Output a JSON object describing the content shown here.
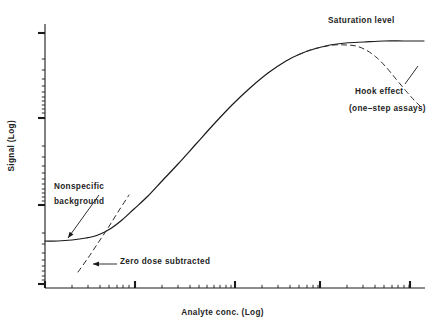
{
  "chart_data": {
    "type": "line",
    "title": "",
    "xlabel": "Analyte conc. (Log)",
    "ylabel": "Signal (Log)",
    "xlim": [
      0,
      5
    ],
    "ylim": [
      0,
      5
    ],
    "grid": false,
    "legend_position": "none",
    "axis_scale": "log-log",
    "annotations": [
      {
        "name": "saturation-level",
        "text": "Saturation level"
      },
      {
        "name": "hook-effect",
        "text": "Hook effect"
      },
      {
        "name": "hook-effect-sub",
        "text": "(one–step assays)"
      },
      {
        "name": "nonspecific-background-line1",
        "text": "Nonspecific"
      },
      {
        "name": "nonspecific-background-line2",
        "text": "background"
      },
      {
        "name": "zero-dose-subtracted",
        "text": "Zero dose subtracted"
      }
    ],
    "series": [
      {
        "name": "Standard curve (sigmoidal, two-step assay)",
        "style": "solid",
        "color": "#1a1a1a",
        "points": [
          [
            45,
            241
          ],
          [
            58,
            241
          ],
          [
            72,
            240
          ],
          [
            86,
            238
          ],
          [
            98,
            235
          ],
          [
            110,
            229
          ],
          [
            122,
            220
          ],
          [
            134,
            209
          ],
          [
            148,
            196
          ],
          [
            162,
            181
          ],
          [
            178,
            164
          ],
          [
            196,
            144
          ],
          [
            214,
            124
          ],
          [
            232,
            105
          ],
          [
            250,
            88
          ],
          [
            268,
            73
          ],
          [
            286,
            61
          ],
          [
            300,
            54
          ],
          [
            314,
            49
          ],
          [
            330,
            45
          ],
          [
            346,
            43
          ],
          [
            364,
            42
          ],
          [
            384,
            41
          ],
          [
            404,
            41
          ],
          [
            424,
            41
          ]
        ]
      },
      {
        "name": "Hook effect (one-step assays)",
        "style": "dashed",
        "color": "#2b2b2b",
        "points": [
          [
            298,
            55
          ],
          [
            310,
            50
          ],
          [
            322,
            47
          ],
          [
            334,
            45
          ],
          [
            346,
            45
          ],
          [
            356,
            46
          ],
          [
            366,
            50
          ],
          [
            376,
            57
          ],
          [
            386,
            67
          ],
          [
            396,
            79
          ],
          [
            406,
            91
          ],
          [
            414,
            100
          ],
          [
            421,
            107
          ]
        ]
      },
      {
        "name": "Zero dose subtracted",
        "style": "dashed",
        "color": "#2b2b2b",
        "points": [
          [
            78,
            272
          ],
          [
            88,
            258
          ],
          [
            98,
            243
          ],
          [
            108,
            228
          ],
          [
            118,
            212
          ],
          [
            129,
            195
          ]
        ]
      }
    ],
    "axes": {
      "x_axis_y": 288,
      "x_axis_start": 45,
      "x_axis_end": 425,
      "y_axis_x": 45,
      "y_axis_top": 24,
      "y_axis_bottom": 288,
      "x_major_ticks": [
        45,
        135,
        235,
        320,
        410
      ],
      "x_minor_ticks": [
        72,
        88,
        100,
        109,
        117,
        123,
        129,
        162,
        178,
        190,
        199,
        207,
        214,
        220,
        226,
        231,
        262,
        278,
        290,
        299,
        307,
        313,
        318,
        347,
        363,
        375,
        384,
        392,
        398,
        404,
        409
      ],
      "y_major_ticks": [
        33,
        118,
        205,
        284
      ],
      "y_minor_ticks": [
        59,
        70,
        79,
        86,
        92,
        97,
        101,
        105,
        109,
        113,
        146,
        157,
        166,
        173,
        179,
        184,
        189,
        193,
        197,
        201,
        233,
        244,
        253,
        260,
        266,
        271,
        276,
        280
      ],
      "tick_color": "#1a1a1a"
    },
    "pointers": [
      {
        "name": "nonspecific-background-arrow",
        "from": [
          99,
          195
        ],
        "to": [
          68,
          238
        ],
        "head": "to"
      },
      {
        "name": "zero-dose-subtracted-arrow",
        "from": [
          117,
          264
        ],
        "to": [
          93,
          264
        ],
        "head": "to"
      },
      {
        "name": "hook-effect-pointer",
        "from": [
          405,
          84
        ],
        "to": [
          418,
          66
        ],
        "head": "none"
      }
    ]
  }
}
